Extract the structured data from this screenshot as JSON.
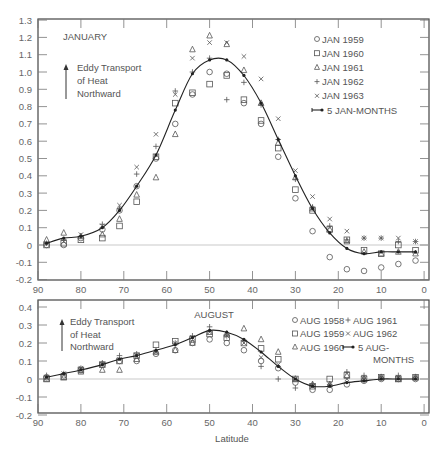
{
  "chart_data": [
    {
      "type": "scatter",
      "title": "JANUARY",
      "annotation": "Eddy Transport of Heat Northward",
      "annotation_lines": [
        "Eddy Transport",
        "of Heat",
        "Northward"
      ],
      "xlabel": "",
      "ylabel": "",
      "xlim": [
        90,
        0
      ],
      "ylim": [
        -0.2,
        1.3
      ],
      "x_ticks": [
        90,
        80,
        70,
        60,
        50,
        40,
        30,
        20,
        10,
        0
      ],
      "y_ticks": [
        -0.2,
        -0.1,
        0,
        0.1,
        0.2,
        0.3,
        0.4,
        0.5,
        0.6,
        0.7,
        0.8,
        0.9,
        1.0,
        1.1,
        1.2,
        1.3
      ],
      "y_tick_labels": [
        "-0.2",
        "-0.1",
        "0",
        "0.1",
        "0.2",
        "0.3",
        "0.4",
        "0.5",
        "0.6",
        "0.7",
        "0.8",
        "0.9",
        "1.0",
        "1.1",
        "1.2",
        "1.3"
      ],
      "grid": false,
      "legend_position": "upper right",
      "legend": [
        {
          "marker": "circle",
          "label": "JAN 1959"
        },
        {
          "marker": "square",
          "label": "JAN 1960"
        },
        {
          "marker": "triangle",
          "label": "JAN 1961"
        },
        {
          "marker": "plus",
          "label": "JAN 1962"
        },
        {
          "marker": "x",
          "label": "JAN 1963"
        },
        {
          "marker": "line-dot",
          "label": "5 JAN-MONTHS"
        }
      ],
      "x": [
        88,
        84,
        80,
        75,
        71,
        67,
        62.5,
        58,
        54,
        50,
        46,
        42,
        38,
        34,
        30,
        26,
        22,
        18,
        14,
        10,
        6,
        2
      ],
      "series": [
        {
          "name": "JAN 1959",
          "marker": "circle",
          "values": [
            0.0,
            0.0,
            0.04,
            0.09,
            0.2,
            0.34,
            0.5,
            0.7,
            0.87,
            1.0,
            0.99,
            0.82,
            0.7,
            0.51,
            0.27,
            0.08,
            -0.07,
            -0.14,
            -0.15,
            -0.13,
            -0.11,
            -0.09
          ]
        },
        {
          "name": "JAN 1960",
          "marker": "square",
          "values": [
            0.0,
            0.01,
            0.03,
            0.04,
            0.11,
            0.25,
            0.51,
            0.82,
            0.88,
            0.93,
            0.98,
            0.84,
            0.72,
            0.56,
            0.32,
            0.2,
            0.09,
            0.03,
            -0.03,
            -0.05,
            0.0,
            -0.03
          ]
        },
        {
          "name": "JAN 1961",
          "marker": "triangle",
          "values": [
            0.03,
            0.07,
            0.05,
            0.06,
            0.15,
            0.29,
            0.39,
            0.64,
            1.13,
            1.21,
            1.16,
            1.01,
            0.82,
            0.59,
            0.39,
            0.21,
            0.09,
            0.02,
            -0.04,
            -0.05,
            -0.04,
            -0.05
          ]
        },
        {
          "name": "JAN 1962",
          "marker": "plus",
          "values": [
            0.01,
            0.03,
            0.05,
            0.12,
            0.21,
            0.41,
            0.57,
            0.89,
            1.0,
            1.08,
            0.84,
            0.94,
            0.81,
            0.61,
            0.38,
            0.22,
            0.11,
            0.03,
            0.04,
            0.04,
            0.02,
            0.02
          ]
        },
        {
          "name": "JAN 1963",
          "marker": "x",
          "values": [
            0.01,
            0.02,
            0.06,
            0.11,
            0.23,
            0.45,
            0.64,
            0.87,
            1.08,
            1.17,
            1.17,
            1.09,
            0.96,
            0.73,
            0.43,
            0.28,
            0.15,
            0.08,
            0.04,
            0.04,
            0.04,
            0.02
          ]
        },
        {
          "name": "5 JAN-MONTHS",
          "marker": "line-dot",
          "values": [
            0.01,
            0.04,
            0.05,
            0.1,
            0.2,
            0.34,
            0.52,
            0.78,
            0.99,
            1.07,
            1.07,
            0.98,
            0.82,
            0.61,
            0.4,
            0.21,
            0.07,
            -0.02,
            -0.05,
            -0.04,
            -0.04,
            -0.04
          ]
        }
      ]
    },
    {
      "type": "scatter",
      "title": "AUGUST",
      "annotation": "Eddy Transport of Heat Northward",
      "annotation_lines": [
        "Eddy Transport",
        "of Heat",
        "Northward"
      ],
      "xlabel": "Latitude",
      "ylabel": "",
      "xlim": [
        90,
        0
      ],
      "ylim": [
        -0.2,
        0.4
      ],
      "x_ticks": [
        90,
        80,
        70,
        60,
        50,
        40,
        30,
        20,
        10,
        0
      ],
      "y_ticks": [
        -0.2,
        -0.1,
        0,
        0.1,
        0.2,
        0.3,
        0.4
      ],
      "y_tick_labels": [
        "-0.2",
        "-0.1",
        "0",
        "0.1",
        "0.2",
        "0.3",
        "0.4"
      ],
      "grid": false,
      "legend_position": "upper right",
      "legend": [
        {
          "marker": "circle",
          "label": "AUG 1958"
        },
        {
          "marker": "plus",
          "label": "AUG 1961"
        },
        {
          "marker": "square",
          "label": "AUG 1959"
        },
        {
          "marker": "x",
          "label": "AUG 1962"
        },
        {
          "marker": "triangle",
          "label": "AUG 1960"
        },
        {
          "marker": "line-dot",
          "label": "5 AUG-MONTHS"
        }
      ],
      "x": [
        88,
        84,
        80,
        75,
        71,
        67,
        62.5,
        58,
        54,
        50,
        46,
        42,
        38,
        34,
        30,
        26,
        22,
        18,
        14,
        10,
        6,
        2
      ],
      "series": [
        {
          "name": "AUG 1958",
          "marker": "circle",
          "values": [
            0.01,
            0.02,
            0.05,
            0.08,
            0.1,
            0.1,
            0.14,
            0.16,
            0.2,
            0.22,
            0.2,
            0.16,
            0.1,
            0.06,
            -0.02,
            -0.06,
            -0.06,
            -0.03,
            -0.01,
            0.0,
            0.0,
            0.0
          ]
        },
        {
          "name": "AUG 1959",
          "marker": "square",
          "values": [
            0.0,
            0.01,
            0.05,
            0.08,
            0.1,
            0.13,
            0.19,
            0.21,
            0.22,
            0.25,
            0.23,
            0.2,
            0.17,
            0.11,
            0.0,
            -0.04,
            0.0,
            0.02,
            0.0,
            0.01,
            0.0,
            0.01
          ]
        },
        {
          "name": "AUG 1960",
          "marker": "triangle",
          "values": [
            0.0,
            0.01,
            0.04,
            0.05,
            0.05,
            0.11,
            0.15,
            0.16,
            0.2,
            0.26,
            0.25,
            0.28,
            0.22,
            0.15,
            0.0,
            -0.03,
            -0.03,
            0.02,
            0.0,
            0.01,
            0.0,
            0.01
          ]
        },
        {
          "name": "AUG 1961",
          "marker": "plus",
          "values": [
            0.02,
            0.03,
            0.06,
            0.09,
            0.13,
            0.14,
            0.15,
            0.2,
            0.24,
            0.29,
            0.24,
            0.21,
            0.07,
            0.0,
            -0.05,
            -0.03,
            -0.03,
            0.04,
            0.02,
            0.01,
            0.02,
            0.01
          ]
        },
        {
          "name": "AUG 1962",
          "marker": "x",
          "values": [
            0.01,
            0.03,
            0.06,
            0.08,
            0.11,
            0.13,
            0.15,
            0.2,
            0.23,
            0.26,
            0.24,
            0.2,
            0.12,
            0.08,
            0.0,
            -0.04,
            -0.03,
            0.0,
            0.0,
            0.01,
            0.01,
            0.01
          ]
        },
        {
          "name": "5 AUG-MONTHS",
          "marker": "line-dot",
          "values": [
            0.01,
            0.03,
            0.05,
            0.08,
            0.11,
            0.13,
            0.16,
            0.19,
            0.23,
            0.27,
            0.26,
            0.22,
            0.15,
            0.07,
            0.0,
            -0.04,
            -0.04,
            -0.02,
            -0.01,
            0.0,
            0.0,
            0.0
          ]
        }
      ]
    }
  ]
}
